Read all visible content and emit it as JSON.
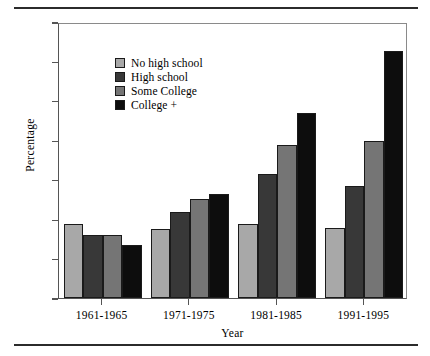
{
  "chart_data": {
    "type": "bar",
    "title": "",
    "xlabel": "Year",
    "ylabel": "Percentage",
    "ylim": [
      0,
      70
    ],
    "yticks": [
      0,
      10,
      20,
      30,
      40,
      50,
      60,
      70
    ],
    "grid": false,
    "legend_position": "top-left",
    "categories": [
      "1961-1965",
      "1971-1975",
      "1981-1985",
      "1991-1995"
    ],
    "series": [
      {
        "name": "No high school",
        "color": "#a8a8a8",
        "values": [
          18.8,
          17.5,
          18.8,
          17.7
        ]
      },
      {
        "name": "High school",
        "color": "#383838",
        "values": [
          16.0,
          21.8,
          31.5,
          28.5
        ]
      },
      {
        "name": "Some College",
        "color": "#757575",
        "values": [
          16.0,
          25.2,
          38.8,
          39.7
        ]
      },
      {
        "name": "College +",
        "color": "#0d0d0d",
        "values": [
          13.5,
          26.5,
          46.8,
          62.7
        ]
      }
    ]
  },
  "figure": {
    "rule_color": "#2b2b2b",
    "axis_color": "#555555",
    "bar_edge_color": "#1a1a1a"
  }
}
